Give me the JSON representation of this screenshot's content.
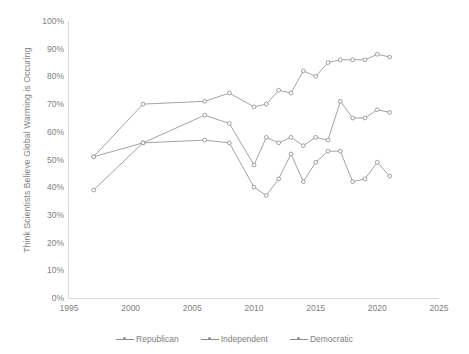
{
  "chart_data": {
    "type": "line",
    "title": "",
    "xlabel": "",
    "ylabel": "Think Scientists Believe Global Warming is Occuring",
    "xlim": [
      1995,
      2025
    ],
    "ylim": [
      0,
      100
    ],
    "y_tick_labels": [
      "0%",
      "10%",
      "20%",
      "30%",
      "40%",
      "50%",
      "60%",
      "70%",
      "80%",
      "90%",
      "100%"
    ],
    "y_tick_values": [
      0,
      10,
      20,
      30,
      40,
      50,
      60,
      70,
      80,
      90,
      100
    ],
    "x_tick_labels": [
      "1995",
      "2000",
      "2005",
      "2010",
      "2015",
      "2020",
      "2025"
    ],
    "x_tick_values": [
      1995,
      2000,
      2005,
      2010,
      2015,
      2020,
      2025
    ],
    "grid": false,
    "legend_position": "bottom",
    "line_color": "#8c8c8c",
    "marker_color": "#8c8c8c",
    "x": [
      1997,
      2001,
      2006,
      2008,
      2010,
      2011,
      2012,
      2013,
      2014,
      2015,
      2016,
      2017,
      2018,
      2019,
      2020,
      2021
    ],
    "series": [
      {
        "name": "Republican",
        "values": [
          39,
          56,
          57,
          56,
          40,
          37,
          43,
          52,
          42,
          49,
          53,
          53,
          42,
          43,
          49,
          44
        ]
      },
      {
        "name": "Independent",
        "values": [
          51,
          56,
          66,
          63,
          48,
          58,
          56,
          58,
          55,
          58,
          57,
          71,
          65,
          65,
          68,
          67
        ]
      },
      {
        "name": "Democratic",
        "values": [
          51,
          70,
          71,
          74,
          69,
          70,
          75,
          74,
          82,
          80,
          85,
          86,
          86,
          86,
          88,
          87
        ]
      }
    ]
  },
  "legend": {
    "items": [
      {
        "label": "Republican"
      },
      {
        "label": "Independent"
      },
      {
        "label": "Democratic"
      }
    ]
  }
}
